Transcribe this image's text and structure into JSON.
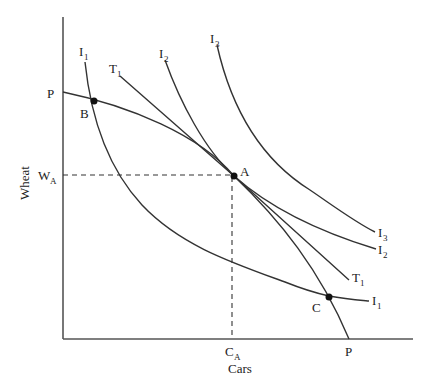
{
  "diagram": {
    "type": "production-possibility-frontier-with-indifference-curves",
    "axes": {
      "x_label": "Cars",
      "y_label": "Wheat"
    },
    "curves": {
      "ppf": {
        "label_y_intercept": "P",
        "label_x_intercept": "P"
      },
      "terms_of_trade_line": {
        "label_main": "T",
        "label_sub": "1"
      },
      "indifference_1": {
        "label_main": "I",
        "label_sub": "1"
      },
      "indifference_2": {
        "label_main": "I",
        "label_sub": "2"
      },
      "indifference_3": {
        "label_main": "I",
        "label_sub": "3"
      }
    },
    "points": {
      "A": {
        "label": "A"
      },
      "B": {
        "label": "B"
      },
      "C": {
        "label": "C"
      }
    },
    "reference_lines": {
      "wheat_at_A": {
        "label_main": "W",
        "label_sub": "A"
      },
      "cars_at_A": {
        "label_main": "C",
        "label_sub": "A"
      }
    },
    "colors": {
      "line": "#333333",
      "axis": "#555555",
      "background": "#ffffff"
    }
  }
}
